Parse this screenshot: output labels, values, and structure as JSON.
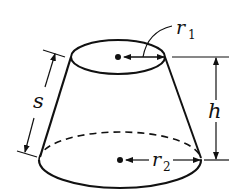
{
  "diagram": {
    "labels": {
      "r1": "r",
      "r1_sub": "1",
      "r2": "r",
      "r2_sub": "2",
      "h": "h",
      "s": "s"
    },
    "colors": {
      "stroke": "#111111",
      "background": "#ffffff"
    }
  }
}
